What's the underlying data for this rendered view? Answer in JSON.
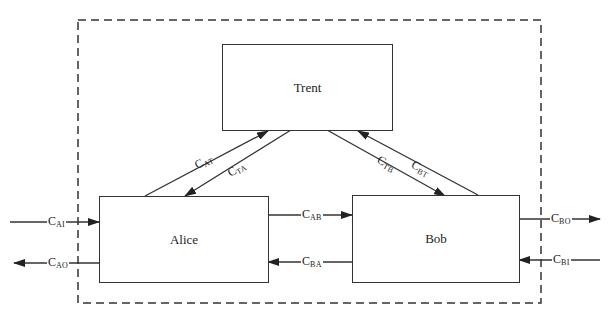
{
  "diagram": {
    "boundary": "dashed",
    "nodes": {
      "trent": {
        "label": "Trent"
      },
      "alice": {
        "label": "Alice"
      },
      "bob": {
        "label": "Bob"
      }
    },
    "channels": {
      "c_at": {
        "base": "C",
        "sub": "AT",
        "from": "Alice",
        "to": "Trent"
      },
      "c_ta": {
        "base": "C",
        "sub": "TA",
        "from": "Trent",
        "to": "Alice"
      },
      "c_tb": {
        "base": "C",
        "sub": "TB",
        "from": "Trent",
        "to": "Bob"
      },
      "c_bt": {
        "base": "C",
        "sub": "BT",
        "from": "Bob",
        "to": "Trent"
      },
      "c_ab": {
        "base": "C",
        "sub": "AB",
        "from": "Alice",
        "to": "Bob"
      },
      "c_ba": {
        "base": "C",
        "sub": "BA",
        "from": "Bob",
        "to": "Alice"
      },
      "c_ai": {
        "base": "C",
        "sub": "AI",
        "from": "external",
        "to": "Alice"
      },
      "c_ao": {
        "base": "C",
        "sub": "AO",
        "from": "Alice",
        "to": "external"
      },
      "c_bo": {
        "base": "C",
        "sub": "BO",
        "from": "Bob",
        "to": "external"
      },
      "c_bi": {
        "base": "C",
        "sub": "BI",
        "from": "external",
        "to": "Bob"
      }
    }
  }
}
